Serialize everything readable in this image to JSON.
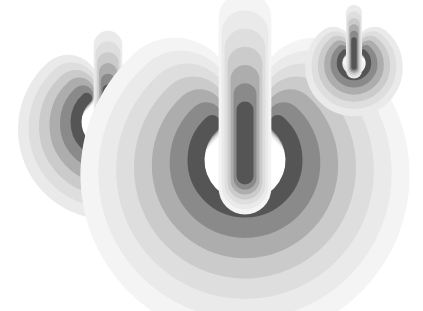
{
  "illustration": {
    "description": "Three power symbols with concentric fading ring echoes",
    "background": "#ffffff",
    "layer_colors": [
      "#f4f4f4",
      "#eaeaea",
      "#dedede",
      "#cbcbcb",
      "#adadad",
      "#8a8a8a",
      "#555555"
    ],
    "icons": [
      {
        "name": "power-icon-left",
        "cx": 108,
        "cy": 122,
        "r": 32,
        "stroke": 11,
        "step": 10,
        "layers": 5,
        "bar_top": 90,
        "bar_bottom": 135
      },
      {
        "name": "power-icon-center",
        "cx": 245,
        "cy": 160,
        "r": 49,
        "stroke": 17,
        "step": 17,
        "layers": 6,
        "bar_top": 110,
        "bar_bottom": 176
      },
      {
        "name": "power-icon-right",
        "cx": 354,
        "cy": 63,
        "r": 14.5,
        "stroke": 5.5,
        "step": 6,
        "layers": 5,
        "bar_top": 40,
        "bar_bottom": 67
      }
    ]
  }
}
